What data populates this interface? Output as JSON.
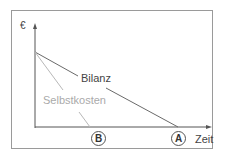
{
  "diagram": {
    "y_axis_label": "€",
    "x_axis_label": "Zeit",
    "series": [
      {
        "name": "Bilanz",
        "color": "#666666",
        "label": "Bilanz",
        "start_value": 0.73,
        "end_marker": "A"
      },
      {
        "name": "Selbstkosten",
        "color": "#b5b5b5",
        "label": "Selbstkosten",
        "start_value": 0.73,
        "end_marker": "B"
      }
    ],
    "markers": [
      {
        "id": "B",
        "label": "B"
      },
      {
        "id": "A",
        "label": "A"
      }
    ]
  }
}
